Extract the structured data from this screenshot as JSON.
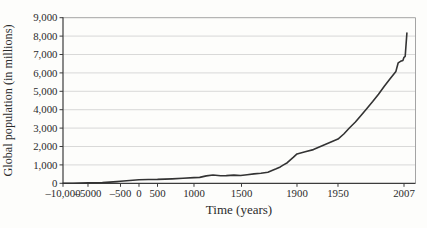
{
  "figure": {
    "background": "#fdfdfb"
  },
  "chart_data": {
    "type": "line",
    "title": "",
    "xlabel": "Time (years)",
    "ylabel": "Global population (in millions)",
    "ylim": [
      0,
      9000
    ],
    "grid": "horizontal",
    "legend": "none",
    "x_axis_note": "non-linear compressed time scale; tick pos = fraction of plot width",
    "x_ticks": [
      {
        "label": "–10,000",
        "year": -10000,
        "pos": 0.0
      },
      {
        "label": "–5000",
        "year": -5000,
        "pos": 0.0709
      },
      {
        "label": "–500",
        "year": -500,
        "pos": 0.1631
      },
      {
        "label": "0",
        "year": 0,
        "pos": 0.2156
      },
      {
        "label": "500",
        "year": 500,
        "pos": 0.2681
      },
      {
        "label": "1000",
        "year": 1000,
        "pos": 0.3716
      },
      {
        "label": "1500",
        "year": 1500,
        "pos": 0.5064
      },
      {
        "label": "1900",
        "year": 1900,
        "pos": 0.6638
      },
      {
        "label": "1950",
        "year": 1950,
        "pos": 0.7801
      },
      {
        "label": "2007",
        "year": 2007,
        "pos": 0.9674
      }
    ],
    "y_ticks": [
      {
        "label": "0",
        "value": 0
      },
      {
        "label": "1,000",
        "value": 1000
      },
      {
        "label": "2,000",
        "value": 2000
      },
      {
        "label": "3,000",
        "value": 3000
      },
      {
        "label": "4,000",
        "value": 4000
      },
      {
        "label": "5,000",
        "value": 5000
      },
      {
        "label": "6,000",
        "value": 6000
      },
      {
        "label": "7,000",
        "value": 7000
      },
      {
        "label": "8,000",
        "value": 8000
      },
      {
        "label": "9,000",
        "value": 9000
      }
    ],
    "series": [
      {
        "name": "Global population (millions)",
        "points": [
          [
            -10000,
            5
          ],
          [
            -8000,
            8
          ],
          [
            -6500,
            12
          ],
          [
            -5000,
            20
          ],
          [
            -4000,
            30
          ],
          [
            -3000,
            45
          ],
          [
            -2000,
            65
          ],
          [
            -1000,
            90
          ],
          [
            -500,
            110
          ],
          [
            -250,
            150
          ],
          [
            0,
            190
          ],
          [
            250,
            205
          ],
          [
            500,
            210
          ],
          [
            700,
            240
          ],
          [
            850,
            270
          ],
          [
            1000,
            310
          ],
          [
            1060,
            320
          ],
          [
            1130,
            400
          ],
          [
            1200,
            450
          ],
          [
            1280,
            410
          ],
          [
            1340,
            420
          ],
          [
            1420,
            445
          ],
          [
            1490,
            425
          ],
          [
            1540,
            465
          ],
          [
            1590,
            510
          ],
          [
            1640,
            545
          ],
          [
            1690,
            600
          ],
          [
            1720,
            690
          ],
          [
            1750,
            790
          ],
          [
            1780,
            890
          ],
          [
            1800,
            990
          ],
          [
            1830,
            1120
          ],
          [
            1850,
            1260
          ],
          [
            1875,
            1420
          ],
          [
            1900,
            1600
          ],
          [
            1910,
            1720
          ],
          [
            1920,
            1830
          ],
          [
            1930,
            2020
          ],
          [
            1940,
            2210
          ],
          [
            1950,
            2400
          ],
          [
            1955,
            2680
          ],
          [
            1960,
            3020
          ],
          [
            1965,
            3330
          ],
          [
            1970,
            3700
          ],
          [
            1975,
            4070
          ],
          [
            1980,
            4440
          ],
          [
            1985,
            4840
          ],
          [
            1990,
            5270
          ],
          [
            1995,
            5680
          ],
          [
            2000,
            6080
          ],
          [
            2002,
            6550
          ],
          [
            2004,
            6630
          ],
          [
            2006,
            6680
          ],
          [
            2007,
            6850
          ],
          [
            2008,
            6900
          ],
          [
            2009.5,
            8170
          ]
        ]
      }
    ],
    "colors": {
      "line": "#333333",
      "grid": "#c8c8c8",
      "axis": "#3c3c3c",
      "frame": "#9a9a9a",
      "text": "#2b2b2b",
      "background": "#fdfdfb"
    }
  }
}
